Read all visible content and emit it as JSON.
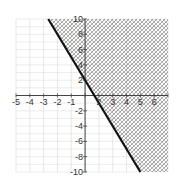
{
  "chart_data": {
    "type": "line",
    "title": "",
    "inequality": "y >= -3x + 2",
    "boundary_line": {
      "slope": -3,
      "intercept": 2,
      "style": "solid",
      "points": [
        [
          -2.667,
          10
        ],
        [
          4,
          -10
        ]
      ]
    },
    "shaded_region": "above-right of line",
    "xlim": [
      -5,
      6
    ],
    "ylim": [
      -10,
      10
    ],
    "x_ticks": [
      "-5",
      "-4",
      "-3",
      "-2",
      "-1",
      "",
      "2",
      "3",
      "4",
      "5",
      "6"
    ],
    "y_ticks": [
      "10",
      "8",
      "6",
      "4",
      "2",
      "-2",
      "-4",
      "-6",
      "-8",
      "-10"
    ],
    "grid": true,
    "xlabel": "",
    "ylabel": "",
    "colors": {
      "line": "#111111",
      "grid": "#d8d8d8",
      "axis": "#444444",
      "hatch": "#777777"
    }
  }
}
